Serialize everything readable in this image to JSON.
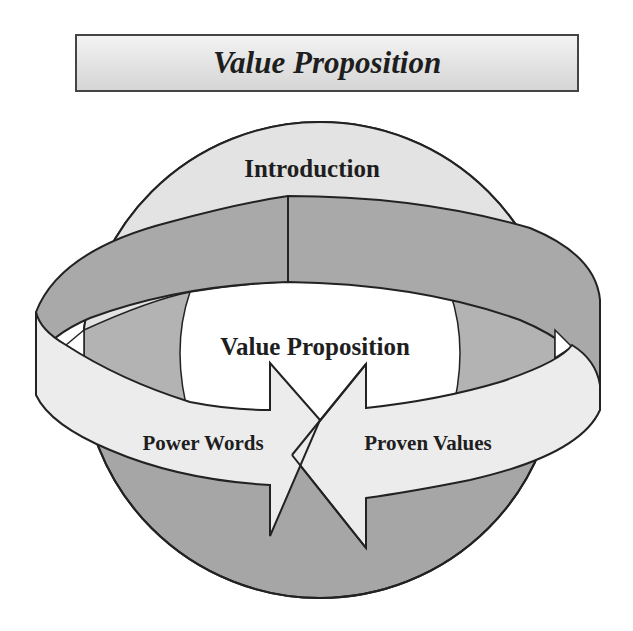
{
  "title": "Value Proposition",
  "diagram": {
    "globe_label": "Introduction",
    "center_label": "Value Proposition",
    "left_arrow_label": "Power Words",
    "right_arrow_label": "Proven Values"
  },
  "colors": {
    "globe_light": "#e3e3e3",
    "band_dark": "#a9a9a9",
    "globe_dark": "#a6a6a6",
    "arrow_fill": "#ececec",
    "center_fill": "#ffffff",
    "outline": "#222222"
  }
}
